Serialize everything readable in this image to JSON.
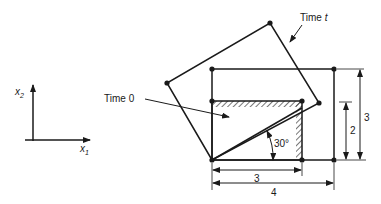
{
  "axes": {
    "x_label": "x",
    "x_sub": "1",
    "y_label": "x",
    "y_sub": "2"
  },
  "labels": {
    "time_0": "Time 0",
    "time_t_prefix": "Time ",
    "time_t_var": "t",
    "angle": "30°"
  },
  "dimensions": {
    "width_small": "3",
    "width_large": "4",
    "height_small": "2",
    "height_large": "3"
  },
  "colors": {
    "line": "#1a1a1a",
    "background": "#ffffff"
  }
}
